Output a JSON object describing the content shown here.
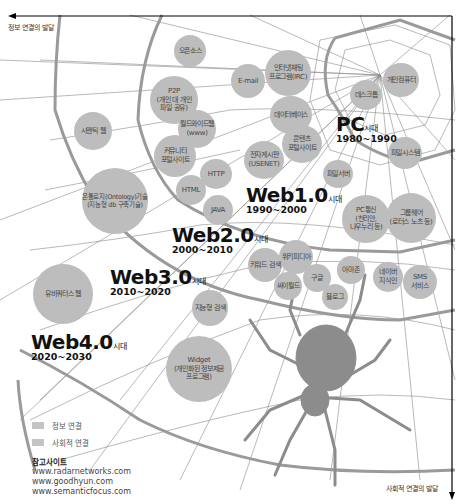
{
  "axes": {
    "horizontal_label": "정보 연결의 발달",
    "vertical_label": "사회적 연결의 발달"
  },
  "eras": [
    {
      "name": "PC",
      "suffix": "시대",
      "years": "1980~1990"
    },
    {
      "name": "Web1.0",
      "suffix": "시대",
      "years": "1990~2000"
    },
    {
      "name": "Web2.0",
      "suffix": "시대",
      "years": "2000~2010"
    },
    {
      "name": "Web3.0",
      "suffix": "시대",
      "years": "2010~2020"
    },
    {
      "name": "Web4.0",
      "suffix": "시대",
      "years": "2020~2030"
    }
  ],
  "nodes": [
    {
      "label": "오픈소스"
    },
    {
      "label": "P2P\n(개인 대 개인\n파일 공유)"
    },
    {
      "label": "E-mail"
    },
    {
      "label": "인터넷채팅\n프로그램(IRC)"
    },
    {
      "label": "시맨틱 웹"
    },
    {
      "label": "월드와이드웹\n(www)"
    },
    {
      "label": "커뮤니티\n포털사이트"
    },
    {
      "label": "데이터베이스"
    },
    {
      "label": "데스크톱"
    },
    {
      "label": "개인컴퓨터"
    },
    {
      "label": "콘텐츠\n포털사이트"
    },
    {
      "label": "전자게시판\n(USENET)"
    },
    {
      "label": "파일시스템"
    },
    {
      "label": "HTTP"
    },
    {
      "label": "HTML"
    },
    {
      "label": "JAVA"
    },
    {
      "label": "파일서버"
    },
    {
      "label": "온톨로지(Ontology)기술\n(지능형 db 구축기술)"
    },
    {
      "label": "PC통신\n(천리안,\n나우누리 등)"
    },
    {
      "label": "그룹웨어\n(로터스 노츠 등)"
    },
    {
      "label": "위키피디아"
    },
    {
      "label": "키워드 검색"
    },
    {
      "label": "아마존"
    },
    {
      "label": "네이버\n지식인"
    },
    {
      "label": "SMS\n서비스"
    },
    {
      "label": "구글"
    },
    {
      "label": "싸이월드"
    },
    {
      "label": "블로그"
    },
    {
      "label": "유비쿼터스 웹"
    },
    {
      "label": "지능형 검색"
    },
    {
      "label": "Widget\n(개인화된 정보제공\n프로그램)"
    }
  ],
  "legend": [
    {
      "label": "정보 연결",
      "color": "#c4c4c4"
    },
    {
      "label": "사회적 연결",
      "color": "#c4c4c4"
    }
  ],
  "references": {
    "title": "참고사이트",
    "sites": [
      "www.radarnetworks.com",
      "www.goodhyun.com",
      "www.semanticfocus.com"
    ]
  },
  "colors": {
    "node_fill": "#bdbdbd",
    "web_thread": "#9a9a9a",
    "spider": "#8c8c8c",
    "axis": "#000000"
  }
}
